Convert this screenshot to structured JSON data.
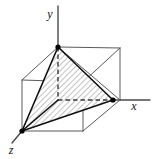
{
  "figure": {
    "type": "geometry-diagram",
    "canvas": {
      "width": 155,
      "height": 159,
      "background": "#ffffff"
    },
    "colors": {
      "line": "#1a1a1a",
      "cube_edge": "#555555",
      "hidden_edge": "#444444",
      "hatch": "#8c8c8c",
      "fill": "#ffffff",
      "label": "#111111",
      "vertex_dot": "#000000"
    },
    "axes": [
      {
        "name": "y",
        "label": "y",
        "label_x": 50,
        "label_y": 18,
        "from": [
          58,
          131
        ],
        "to": [
          58,
          6
        ]
      },
      {
        "name": "x",
        "label": "x",
        "label_x": 134,
        "label_y": 110,
        "from": [
          22,
          100
        ],
        "to": [
          150,
          100
        ]
      },
      {
        "name": "z",
        "label": "z",
        "label_x": 10,
        "label_y": 153,
        "from": [
          58,
          100
        ],
        "to": [
          14,
          144
        ]
      }
    ],
    "points": {
      "origin_hidden": [
        58,
        100
      ],
      "y_vertex": [
        58,
        47
      ],
      "x_vertex": [
        113,
        100
      ],
      "z_vertex": [
        22,
        131
      ],
      "cube_back_top_left": [
        22,
        80
      ],
      "cube_back_top_right": [
        120,
        48
      ],
      "cube_front_top_right": [
        83,
        82
      ],
      "cube_back_bottom_right": [
        120,
        100
      ],
      "cube_front_bottom_right": [
        83,
        131
      ],
      "cube_front_bottom_left": [
        22,
        131
      ],
      "cube_front_top_left": [
        22,
        80
      ],
      "cube_back_top_center": [
        58,
        47
      ]
    },
    "vertex_dots": [
      {
        "name": "y-axis-vertex",
        "cx": 58,
        "cy": 47,
        "r": 2.6
      },
      {
        "name": "x-axis-vertex",
        "cx": 113,
        "cy": 100,
        "r": 2.6
      },
      {
        "name": "z-axis-vertex",
        "cx": 22,
        "cy": 131,
        "r": 2.6
      }
    ],
    "tetrahedron": {
      "name": "shaded-tetrahedron",
      "shaded": true,
      "hatch_angle_deg": 45,
      "faces": [
        {
          "name": "face-y-x-z",
          "points": "58,47 113,100 22,131"
        },
        {
          "name": "face-y-z-origin",
          "points": "58,47 22,131 58,100"
        },
        {
          "name": "face-y-x-origin",
          "points": "58,47 113,100 58,100"
        }
      ],
      "solid_edges": [
        {
          "name": "edge-y-to-z",
          "x1": 58,
          "y1": 47,
          "x2": 22,
          "y2": 131
        },
        {
          "name": "edge-y-to-x",
          "x1": 58,
          "y1": 47,
          "x2": 113,
          "y2": 100
        },
        {
          "name": "edge-z-to-x",
          "x1": 22,
          "y1": 131,
          "x2": 113,
          "y2": 100
        },
        {
          "name": "edge-z-to-origin",
          "x1": 22,
          "y1": 131,
          "x2": 58,
          "y2": 100
        }
      ],
      "dashed_edges": [
        {
          "name": "edge-y-to-origin",
          "x1": 58,
          "y1": 47,
          "x2": 58,
          "y2": 100
        },
        {
          "name": "edge-origin-to-x",
          "x1": 58,
          "y1": 100,
          "x2": 113,
          "y2": 100
        }
      ]
    },
    "cube": {
      "name": "reference-cube",
      "edges": [
        {
          "name": "cube-edge-top-back-left",
          "x1": 22,
          "y1": 80,
          "x2": 58,
          "y2": 47
        },
        {
          "name": "cube-edge-top-back",
          "x1": 58,
          "y1": 47,
          "x2": 120,
          "y2": 48
        },
        {
          "name": "cube-edge-top-right-back",
          "x1": 120,
          "y1": 48,
          "x2": 83,
          "y2": 82
        },
        {
          "name": "cube-edge-top-front",
          "x1": 83,
          "y1": 82,
          "x2": 22,
          "y2": 80
        },
        {
          "name": "cube-edge-vertical-front-left",
          "x1": 22,
          "y1": 80,
          "x2": 22,
          "y2": 131
        },
        {
          "name": "cube-edge-vertical-front-right",
          "x1": 83,
          "y1": 82,
          "x2": 83,
          "y2": 131
        },
        {
          "name": "cube-edge-vertical-back-right",
          "x1": 120,
          "y1": 48,
          "x2": 120,
          "y2": 100
        },
        {
          "name": "cube-edge-bottom-front",
          "x1": 22,
          "y1": 131,
          "x2": 83,
          "y2": 131
        },
        {
          "name": "cube-edge-bottom-right",
          "x1": 83,
          "y1": 131,
          "x2": 120,
          "y2": 100
        },
        {
          "name": "cube-edge-diag-right-upper",
          "x1": 58,
          "y1": 47,
          "x2": 120,
          "y2": 100
        }
      ]
    }
  }
}
